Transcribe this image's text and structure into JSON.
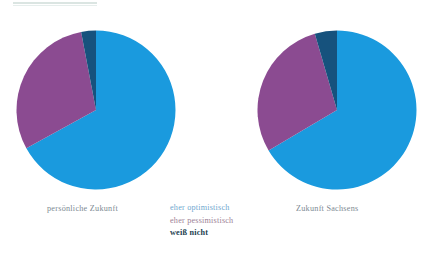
{
  "figure": {
    "top_rule": "horizontal-rule",
    "captions": {
      "left": "persönliche Zukunft",
      "right": "Zukunft Sachsens"
    }
  },
  "legend": {
    "position": "center-bottom",
    "items": [
      {
        "label": "eher optimistisch",
        "color": "#1a9ade",
        "key": "optimistic"
      },
      {
        "label": "eher pessimistisch",
        "color": "#8b4b91",
        "key": "pessimistic"
      },
      {
        "label": "weiß nicht",
        "color": "#16527d",
        "key": "unknown"
      }
    ]
  },
  "chart_data": [
    {
      "type": "pie",
      "title": "persönliche Zukunft",
      "labels": [
        "eher optimistisch",
        "eher pessimistisch",
        "weiß nicht"
      ],
      "values": [
        67,
        30,
        3
      ],
      "colors": [
        "#1a9ade",
        "#8b4b91",
        "#16527d"
      ],
      "unit": "%",
      "start_angle": 0,
      "direction": "clockwise",
      "center": [
        96,
        110
      ],
      "radius": 80,
      "grid": false,
      "legend_position": "center-bottom"
    },
    {
      "type": "pie",
      "title": "Zukunft Sachsens",
      "labels": [
        "eher optimistisch",
        "eher pessimistisch",
        "weiß nicht"
      ],
      "values": [
        66.5,
        29,
        4.5
      ],
      "colors": [
        "#1a9ade",
        "#8b4b91",
        "#16527d"
      ],
      "unit": "%",
      "start_angle": 0,
      "direction": "clockwise",
      "center": [
        337,
        110
      ],
      "radius": 80,
      "grid": false,
      "legend_position": "center-bottom"
    }
  ]
}
